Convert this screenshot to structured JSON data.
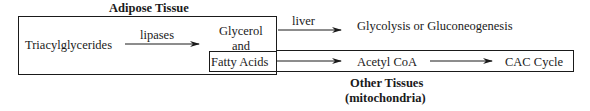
{
  "diagram": {
    "adipose": {
      "title": "Adipose Tissue",
      "substrate": "Triacylglycerides",
      "enzyme": "lipases",
      "product_line1": "Glycerol",
      "product_line2": "and",
      "product_line3": "Fatty Acids"
    },
    "liver_path": {
      "label": "liver",
      "destination": "Glycolysis or Gluconeogenesis"
    },
    "other_tissues": {
      "intermediate": "Acetyl CoA",
      "destination": "CAC Cycle",
      "title_line1": "Other Tissues",
      "title_line2": "(mitochondria)"
    }
  }
}
